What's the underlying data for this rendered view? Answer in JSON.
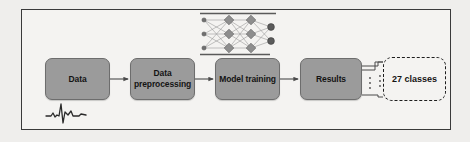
{
  "figure": {
    "panel_background": "#f4f3f1",
    "outer_background": "#efeeec",
    "frame_color": "#3a3a3a",
    "box_fill": "#9b9b9b",
    "box_border": "#6d6d6d",
    "text_color": "#141414",
    "connector_color": "#4a4a4a",
    "dash_box_border": "#1d1d1d"
  },
  "pipeline": {
    "stages": [
      {
        "id": "data",
        "label": "Data",
        "name": "stage-data"
      },
      {
        "id": "preprocessing",
        "label": "Data preprocessing",
        "name": "stage-data-preprocessing"
      },
      {
        "id": "training",
        "label": "Model training",
        "name": "stage-model-training"
      },
      {
        "id": "results",
        "label": "Results",
        "name": "stage-results"
      }
    ],
    "output": {
      "label": "27 classes",
      "style": "dash-dot-rounded-rectangle"
    },
    "arrow_count": 3,
    "fanout_lines": 3,
    "fanout_ellipsis": "vertical-dots"
  },
  "neural_network": {
    "icon_name": "neural-network-icon",
    "layers": [
      {
        "type": "input",
        "nodes": 3,
        "shape": "small-circle",
        "color": "#6f6f6f"
      },
      {
        "type": "hidden1",
        "nodes": 3,
        "shape": "diamond",
        "color": "#8e8e8e"
      },
      {
        "type": "hidden2",
        "nodes": 3,
        "shape": "diamond",
        "color": "#8e8e8e"
      },
      {
        "type": "output",
        "nodes": 2,
        "shape": "circle",
        "color": "#5b5b5b"
      }
    ],
    "edge_color": "#8a8a8a"
  },
  "ecg": {
    "icon_name": "ecg-waveform-icon",
    "stroke_color": "#2a2a2a",
    "description": "QRS complex beat trace"
  }
}
